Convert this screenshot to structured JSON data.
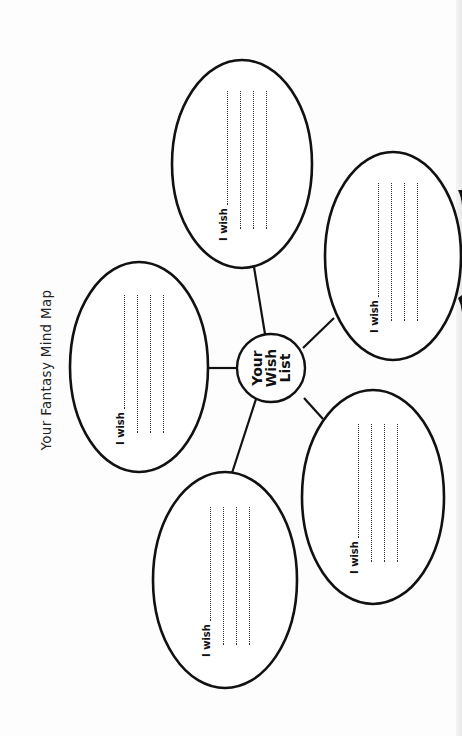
{
  "worksheet": {
    "title": "Your Fantasy Mind Map",
    "center": {
      "lines": [
        "Your",
        "Wish",
        "List"
      ]
    },
    "bubbles": [
      {
        "id": "top",
        "prompt": "I wish",
        "lines": 4,
        "cx": 242,
        "cy": 164,
        "rx": 70,
        "ry": 104
      },
      {
        "id": "upper-left",
        "prompt": "I wish",
        "lines": 4,
        "cx": 139,
        "cy": 367,
        "rx": 69,
        "ry": 105
      },
      {
        "id": "upper-right",
        "prompt": "I wish",
        "lines": 4,
        "cx": 393,
        "cy": 256,
        "rx": 68,
        "ry": 104
      },
      {
        "id": "lower-left",
        "prompt": "I wish",
        "lines": 4,
        "cx": 225,
        "cy": 580,
        "rx": 72,
        "ry": 108
      },
      {
        "id": "lower-right",
        "prompt": "I wish",
        "lines": 4,
        "cx": 373,
        "cy": 497,
        "rx": 71,
        "ry": 107
      }
    ],
    "colors": {
      "ink": "#111111",
      "paper": "#fdfdfd"
    }
  }
}
